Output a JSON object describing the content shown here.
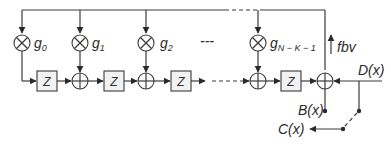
{
  "diagram": {
    "type": "lfsr-encoder-block-diagram",
    "multipliers": [
      {
        "label": "g",
        "sub": "0"
      },
      {
        "label": "g",
        "sub": "1"
      },
      {
        "label": "g",
        "sub": "2"
      },
      {
        "label": "g",
        "sub": "N − K − 1"
      }
    ],
    "delay_label": "Z",
    "feedback_label": "fbv",
    "input_label": "D(x)",
    "parity_label": "B(x)",
    "output_label": "C(x)",
    "ellipsis": "---",
    "colors": {
      "line": "#3a3a3a",
      "box_fill": "#f2f2f2",
      "background": "#ffffff"
    }
  }
}
